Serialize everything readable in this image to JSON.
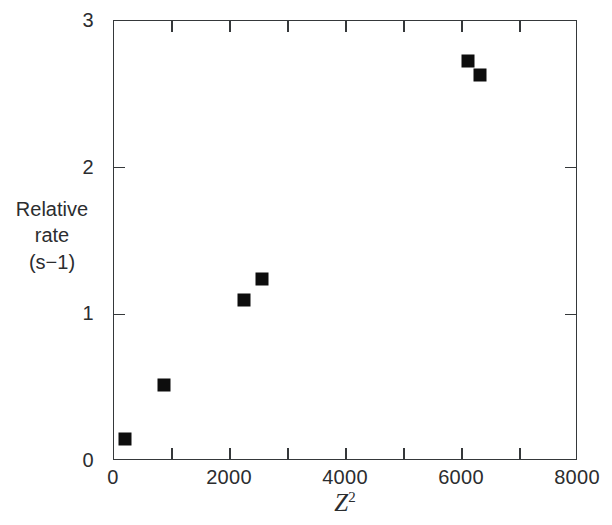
{
  "chart_data": {
    "type": "scatter",
    "title": "",
    "xlabel": "Z2",
    "xlabel_base": "Z",
    "xlabel_exponent": "2",
    "ylabel_lines": [
      "Relative",
      "rate",
      "(s−1)"
    ],
    "ylabel": "Relative rate (s-1)",
    "xlim": [
      0,
      8000
    ],
    "ylim": [
      0,
      3
    ],
    "grid": false,
    "legend": null,
    "marker": "filled-square",
    "marker_color": "#0d0d0d",
    "axis_color": "#35383a",
    "x_major_ticks": [
      0,
      2000,
      4000,
      6000,
      8000
    ],
    "x_minor_ticks": [
      1000,
      3000,
      5000,
      7000
    ],
    "x_tick_labels": [
      "0",
      "2000",
      "4000",
      "6000",
      "8000"
    ],
    "y_major_ticks": [
      0,
      1,
      2,
      3
    ],
    "y_tick_labels": [
      "0",
      "1",
      "2",
      "3"
    ],
    "points": [
      {
        "x": 190,
        "y": 0.15
      },
      {
        "x": 860,
        "y": 0.52
      },
      {
        "x": 2240,
        "y": 1.1
      },
      {
        "x": 2550,
        "y": 1.24
      },
      {
        "x": 6100,
        "y": 2.73
      },
      {
        "x": 6310,
        "y": 2.63
      }
    ]
  }
}
